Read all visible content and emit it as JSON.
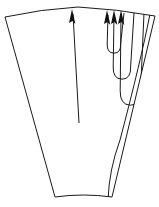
{
  "figure": {
    "canvas": {
      "width": 159,
      "height": 207
    },
    "colors": {
      "background": "#ffffff",
      "stroke": "#1a1a1a",
      "arrowhead_fill": "#111111"
    },
    "stroke_width": 1
  },
  "chart_data": {
    "type": "line",
    "xlabel": "",
    "ylabel": "",
    "grid": false,
    "legend": "none",
    "xlim": [
      0,
      159
    ],
    "ylim": [
      0,
      207
    ],
    "shapes": [
      {
        "name": "wedge-outline",
        "kind": "closed-polygon-with-arcs",
        "vertices": [
          [
            5,
            17
          ],
          [
            55,
            197
          ],
          [
            112,
            197
          ],
          [
            155,
            16
          ]
        ],
        "top_arc_peak": [
          78,
          7
        ],
        "bottom_arc_peak": [
          83,
          193
        ]
      }
    ],
    "series": [
      {
        "name": "central-straight-arrow",
        "kind": "arrow",
        "points": [
          [
            79,
            123
          ],
          [
            73,
            14
          ]
        ],
        "arrowhead_at": "end",
        "arrowhead_tip": [
          72,
          9
        ]
      },
      {
        "name": "loop-arrow-inner",
        "kind": "hairpin-loop",
        "upstroke_x": 108,
        "downstroke_x": 120,
        "top_y": 15,
        "turn_y": 53,
        "arrowhead_at": "upstroke-top",
        "arrowhead_tip": [
          107,
          10
        ]
      },
      {
        "name": "loop-arrow-middle",
        "kind": "hairpin-loop",
        "upstroke_x": 114,
        "downstroke_x": 130,
        "top_y": 15,
        "turn_y": 79,
        "arrowhead_at": "upstroke-top",
        "arrowhead_tip": [
          114,
          10
        ]
      },
      {
        "name": "loop-arrow-outer",
        "kind": "hairpin-loop",
        "upstroke_x": 121,
        "downstroke_x": 140,
        "top_y": 15,
        "turn_y": 105,
        "arrowhead_at": "upstroke-top",
        "arrowhead_tip": [
          121,
          10
        ]
      },
      {
        "name": "trailing-strand",
        "kind": "open-curve",
        "points": [
          [
            150,
            14
          ],
          [
            141,
            60
          ],
          [
            120,
            140
          ],
          [
            108,
            200
          ]
        ]
      }
    ],
    "annotations": []
  }
}
